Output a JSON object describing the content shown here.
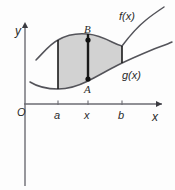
{
  "figure": {
    "kind": "area-between-curves",
    "background_color": "#fdfdfd",
    "axis_color": "#6b6b72",
    "curve_color": "#54545a",
    "fill_color": "#d2d2d2",
    "segment_color": "#1a1a1a",
    "label_color": "#2b2b2b"
  },
  "axes": {
    "y_label": "y",
    "x_label": "x",
    "origin_label": "O"
  },
  "curves": [
    {
      "name": "upper-curve",
      "label": "f(x)"
    },
    {
      "name": "lower-curve",
      "label": "g(x)"
    }
  ],
  "ticks": [
    {
      "name": "tick-a",
      "label": "a",
      "x_px": 58
    },
    {
      "name": "tick-x",
      "label": "x",
      "x_px": 88
    },
    {
      "name": "tick-b",
      "label": "b",
      "x_px": 122
    }
  ],
  "points": [
    {
      "name": "point-A",
      "label": "A",
      "x_px": 88,
      "y_px": 79
    },
    {
      "name": "point-B",
      "label": "B",
      "x_px": 88,
      "y_px": 40
    }
  ],
  "geometry": {
    "y_axis_x": 25,
    "x_axis_y": 104,
    "y_axis_top": 22,
    "y_axis_bottom": 186,
    "x_axis_right": 162,
    "upper_curve_path": "M 36,60 C 44,52 50,44 58,40 C 68,34 78,33 88,34 C 98,35 106,39 112,42 C 118,45 122,46 122,46 C 128,38 136,28 146,20 C 152,15 158,11 164,7",
    "lower_curve_path": "M 30,82 C 38,87 46,89 58,89 C 70,89 80,85 88,81 C 98,76 108,70 118,65 C 130,59 142,54 154,49 C 162,46 168,44 172,42",
    "region_path": "M 58,40 C 68,34 78,33 88,34 C 98,35 106,39 112,42 C 118,45 122,46 122,46 L 122,63 C 112,68 100,75 88,81 C 78,86 68,89 58,89 Z",
    "vertical_a": {
      "x": 58,
      "y_top": 40,
      "y_bottom": 89
    },
    "vertical_x": {
      "x": 88,
      "y_top": 34,
      "y_bottom": 81
    },
    "vertical_b": {
      "x": 122,
      "y_top": 46,
      "y_bottom": 63
    }
  },
  "label_positions": {
    "y_label": {
      "left": 15,
      "top": 25
    },
    "x_label": {
      "left": 152,
      "top": 111
    },
    "origin_label": {
      "left": 17,
      "top": 107
    },
    "f_label": {
      "left": 119,
      "top": 11
    },
    "g_label": {
      "left": 122,
      "top": 70
    },
    "a_label": {
      "left": 54,
      "top": 110
    },
    "x_tick_label": {
      "left": 84,
      "top": 110
    },
    "b_label": {
      "left": 118,
      "top": 110
    },
    "A_label": {
      "left": 84,
      "top": 84
    },
    "B_label": {
      "left": 84,
      "top": 24
    }
  }
}
